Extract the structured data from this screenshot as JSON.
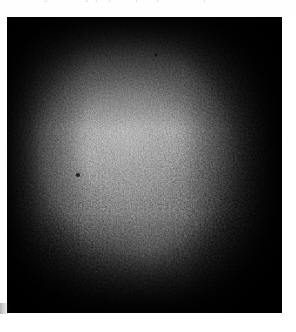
{
  "page": {
    "background_color": "#ffffff",
    "width": 296,
    "height": 332
  },
  "caption": {
    "text": "Figure 1. Photograph of the sample surface under dim field illumination.",
    "style": "italic",
    "align": "center",
    "color": "#c9c9c9",
    "note": "cropped by top page edge"
  },
  "figure": {
    "label": "dark grainy photographic plate",
    "media_type": "photograph",
    "frame": {
      "x": 7,
      "y": 17,
      "width": 275,
      "height": 296
    },
    "background_color": "#040404",
    "appearance": {
      "grain": "heavy",
      "vignette": "strong",
      "highlight_center": {
        "x_pct": 44,
        "y_pct": 40
      },
      "highlight_color": "#8f8f8f",
      "shadow_color": "#000000",
      "midtone_color": "#6e6e6e"
    }
  }
}
